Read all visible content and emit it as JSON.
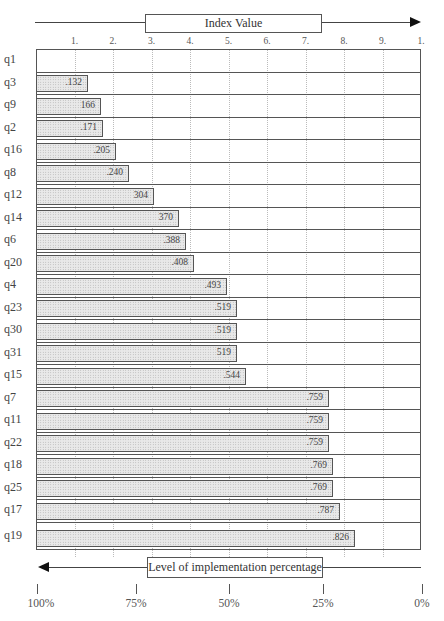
{
  "chart_data": {
    "type": "bar",
    "orientation": "horizontal",
    "title": "",
    "top_axis_label": "Index Value",
    "bottom_axis_label": "Level of implementation percentage",
    "top_axis_ticks": [
      "1.",
      "2.",
      "3.",
      "4.",
      "5.",
      "6.",
      "7.",
      "8.",
      "9.",
      "1."
    ],
    "top_axis_tick_values": [
      0.1,
      0.2,
      0.3,
      0.4,
      0.5,
      0.6,
      0.7,
      0.8,
      0.9,
      1.0
    ],
    "bottom_axis_ticks": [
      "100%",
      "75%",
      "50%",
      "25%",
      "0%"
    ],
    "xlim": [
      0,
      1
    ],
    "grid": true,
    "categories": [
      "q1",
      "q3",
      "q9",
      "q2",
      "q16",
      "q8",
      "q12",
      "q14",
      "q6",
      "q20",
      "q4",
      "q23",
      "q30",
      "q31",
      "q15",
      "q7",
      "q11",
      "q22",
      "q18",
      "q25",
      "q17",
      "q19"
    ],
    "values": [
      0,
      0.132,
      0.166,
      0.171,
      0.205,
      0.24,
      0.304,
      0.37,
      0.388,
      0.408,
      0.493,
      0.519,
      0.519,
      0.519,
      0.544,
      0.759,
      0.759,
      0.759,
      0.769,
      0.769,
      0.787,
      0.826
    ],
    "value_labels": [
      "",
      ".132",
      "166",
      ".171",
      ".205",
      ".240",
      "304",
      "370",
      ".388",
      ".408",
      ".493",
      ".519",
      ".519",
      "519",
      ".544",
      ".759",
      ".759",
      ".759",
      ".769",
      ".769",
      ".787",
      ".826"
    ]
  },
  "axes": {
    "top_title": "Index Value",
    "bottom_title": "Level of implementation percentage",
    "top_ticks": [
      "1.",
      "2.",
      "3.",
      "4.",
      "5.",
      "6.",
      "7.",
      "8.",
      "9.",
      "1."
    ],
    "pct_ticks": [
      "100%",
      "75%",
      "50%",
      "25%",
      "0%"
    ]
  },
  "rows": [
    {
      "label": "q1",
      "value": ""
    },
    {
      "label": "q3",
      "value": ".132"
    },
    {
      "label": "q9",
      "value": "166"
    },
    {
      "label": "q2",
      "value": ".171"
    },
    {
      "label": "q16",
      "value": ".205"
    },
    {
      "label": "q8",
      "value": ".240"
    },
    {
      "label": "q12",
      "value": "304"
    },
    {
      "label": "q14",
      "value": "370"
    },
    {
      "label": "q6",
      "value": ".388"
    },
    {
      "label": "q20",
      "value": ".408"
    },
    {
      "label": "q4",
      "value": ".493"
    },
    {
      "label": "q23",
      "value": ".519"
    },
    {
      "label": "q30",
      "value": ".519"
    },
    {
      "label": "q31",
      "value": "519"
    },
    {
      "label": "q15",
      "value": ".544"
    },
    {
      "label": "q7",
      "value": ".759"
    },
    {
      "label": "q11",
      "value": ".759"
    },
    {
      "label": "q22",
      "value": ".759"
    },
    {
      "label": "q18",
      "value": ".769"
    },
    {
      "label": "q25",
      "value": ".769"
    },
    {
      "label": "q17",
      "value": ".787"
    },
    {
      "label": "q19",
      "value": ".826"
    }
  ],
  "colors": {
    "bar_fill": "#e9e9e9",
    "border": "#555555",
    "arrow": "#111111"
  }
}
